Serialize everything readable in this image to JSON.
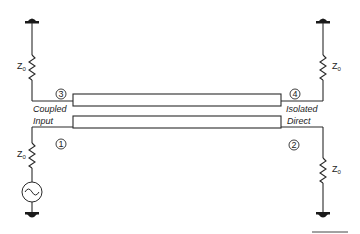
{
  "diagram": {
    "type": "directional-coupler-schematic",
    "ports": [
      {
        "number": "1",
        "label": "Input"
      },
      {
        "number": "2",
        "label": "Direct"
      },
      {
        "number": "3",
        "label": "Coupled"
      },
      {
        "number": "4",
        "label": "Isolated"
      }
    ],
    "terminations": [
      {
        "position": "top-left",
        "label": "Z",
        "subscript": "0"
      },
      {
        "position": "top-right",
        "label": "Z",
        "subscript": "0"
      },
      {
        "position": "bottom-left",
        "label": "Z",
        "subscript": "0"
      },
      {
        "position": "bottom-right",
        "label": "Z",
        "subscript": "0"
      }
    ],
    "source": {
      "symbol": "ac-source-icon"
    },
    "colors": {
      "line": "#2a2a2a",
      "background": "#ffffff"
    }
  }
}
